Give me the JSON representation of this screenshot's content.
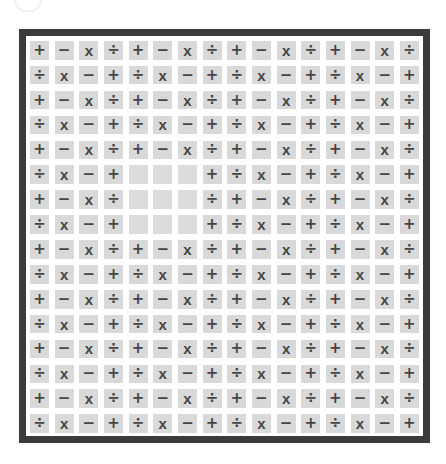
{
  "board": {
    "rows": 16,
    "cols": 16,
    "colors": {
      "frame": "#3b3b3b",
      "cell_bg": "#d9d9d9",
      "symbol": "#454545",
      "background": "#ffffff"
    },
    "icons": {
      "+": "plus-icon",
      "−": "minus-icon",
      "x": "multiply-icon",
      "÷": "divide-icon",
      "": "empty-slot"
    },
    "grid": [
      [
        "+",
        "−",
        "x",
        "÷",
        "+",
        "−",
        "x",
        "÷",
        "+",
        "−",
        "x",
        "÷",
        "+",
        "−",
        "x",
        "÷"
      ],
      [
        "÷",
        "x",
        "−",
        "+",
        "÷",
        "x",
        "−",
        "+",
        "÷",
        "x",
        "−",
        "+",
        "÷",
        "x",
        "−",
        "+"
      ],
      [
        "+",
        "−",
        "x",
        "÷",
        "+",
        "−",
        "x",
        "÷",
        "+",
        "−",
        "x",
        "÷",
        "+",
        "−",
        "x",
        "÷"
      ],
      [
        "÷",
        "x",
        "−",
        "+",
        "÷",
        "x",
        "−",
        "+",
        "÷",
        "x",
        "−",
        "+",
        "÷",
        "x",
        "−",
        "+"
      ],
      [
        "+",
        "−",
        "x",
        "÷",
        "+",
        "−",
        "x",
        "÷",
        "+",
        "−",
        "x",
        "÷",
        "+",
        "−",
        "x",
        "÷"
      ],
      [
        "÷",
        "x",
        "−",
        "+",
        "",
        "",
        "",
        "+",
        "÷",
        "x",
        "−",
        "+",
        "÷",
        "x",
        "−",
        "+"
      ],
      [
        "+",
        "−",
        "x",
        "÷",
        "",
        "",
        "",
        "÷",
        "+",
        "−",
        "x",
        "÷",
        "+",
        "−",
        "x",
        "÷"
      ],
      [
        "÷",
        "x",
        "−",
        "+",
        "",
        "",
        "",
        "+",
        "÷",
        "x",
        "−",
        "+",
        "÷",
        "x",
        "−",
        "+"
      ],
      [
        "+",
        "−",
        "x",
        "÷",
        "+",
        "−",
        "x",
        "÷",
        "+",
        "−",
        "x",
        "÷",
        "+",
        "−",
        "x",
        "÷"
      ],
      [
        "÷",
        "x",
        "−",
        "+",
        "÷",
        "x",
        "−",
        "+",
        "÷",
        "x",
        "−",
        "+",
        "÷",
        "x",
        "−",
        "+"
      ],
      [
        "+",
        "−",
        "x",
        "÷",
        "+",
        "−",
        "x",
        "÷",
        "+",
        "−",
        "x",
        "÷",
        "+",
        "−",
        "x",
        "÷"
      ],
      [
        "÷",
        "x",
        "−",
        "+",
        "÷",
        "x",
        "−",
        "+",
        "÷",
        "x",
        "−",
        "+",
        "÷",
        "x",
        "−",
        "+"
      ],
      [
        "+",
        "−",
        "x",
        "÷",
        "+",
        "−",
        "x",
        "÷",
        "+",
        "−",
        "x",
        "÷",
        "+",
        "−",
        "x",
        "÷"
      ],
      [
        "÷",
        "x",
        "−",
        "+",
        "÷",
        "x",
        "−",
        "+",
        "÷",
        "x",
        "−",
        "+",
        "÷",
        "x",
        "−",
        "+"
      ],
      [
        "+",
        "−",
        "x",
        "÷",
        "+",
        "−",
        "x",
        "÷",
        "+",
        "−",
        "x",
        "÷",
        "+",
        "−",
        "x",
        "÷"
      ],
      [
        "÷",
        "x",
        "−",
        "+",
        "÷",
        "x",
        "−",
        "+",
        "÷",
        "x",
        "−",
        "+",
        "÷",
        "x",
        "−",
        "+"
      ]
    ],
    "missing_cells": [
      [
        6,
        5
      ],
      [
        6,
        6
      ],
      [
        6,
        7
      ],
      [
        7,
        5
      ],
      [
        7,
        6
      ],
      [
        7,
        7
      ],
      [
        8,
        5
      ],
      [
        8,
        6
      ],
      [
        8,
        7
      ]
    ]
  }
}
